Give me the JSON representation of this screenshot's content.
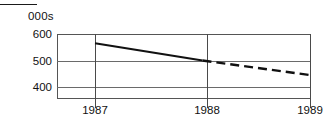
{
  "caption": {
    "units_label": "000s"
  },
  "chart_data": {
    "type": "line",
    "title": "",
    "subtitle": "",
    "xlabel": "",
    "ylabel": "000s",
    "x": [
      1987,
      1988,
      1989
    ],
    "categories": [
      "1987",
      "1988",
      "1989"
    ],
    "xtick_labels": [
      "1987",
      "1988",
      "1989"
    ],
    "ytick_labels": [
      "600",
      "500",
      "400"
    ],
    "yticks": [
      600,
      500,
      400
    ],
    "ylim": [
      350,
      600
    ],
    "xlim": [
      1986.6,
      1989.0
    ],
    "grid": true,
    "legend": false,
    "legend_position": "none",
    "series": [
      {
        "name": "actual",
        "style": "solid",
        "color": "#111111",
        "x": [
          1987,
          1988
        ],
        "values": [
          565,
          500
        ]
      },
      {
        "name": "forecast",
        "style": "dashed",
        "color": "#111111",
        "x": [
          1988,
          1989
        ],
        "values": [
          500,
          445
        ]
      }
    ],
    "annotations": []
  },
  "colors": {
    "line": "#111111",
    "axis": "#555555",
    "grid": "#6a6a6a",
    "text": "#111111",
    "background": "#ffffff"
  }
}
